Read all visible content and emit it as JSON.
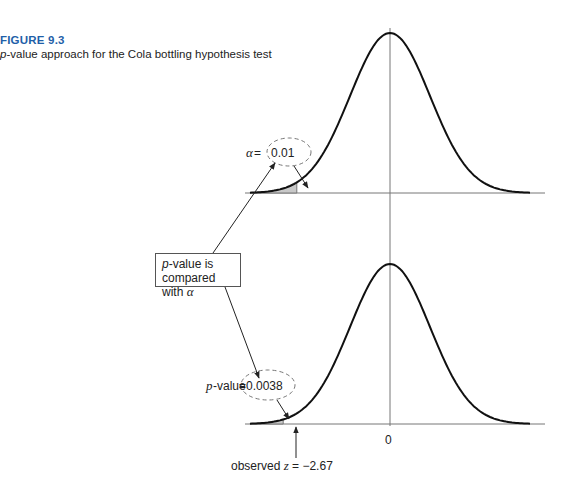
{
  "figure": {
    "label": "FIGURE 9.3",
    "caption_prefix_italic": "p",
    "caption_rest": "-value approach for the Cola bottling hypothesis test"
  },
  "top_panel": {
    "annotation_symbol": "α",
    "annotation_eq": " = ",
    "annotation_value": "0.01"
  },
  "bottom_panel": {
    "annotation_prefix_italic": "p",
    "annotation_label": "-value",
    "annotation_eq": " = ",
    "annotation_value": "0.0038",
    "axis_zero_label": "0",
    "observed_label": "observed ",
    "observed_var": "z",
    "observed_value": " = −2.67"
  },
  "comparison_box": {
    "line1_italic": "p",
    "line1_rest": "-value is",
    "line2": "compared with ",
    "line2_symbol": "α"
  },
  "colors": {
    "figure_label": "#1f5fa8",
    "curve": "#111111",
    "axis": "#777777",
    "shade": "#c8c8c8",
    "dashed": "#777777"
  },
  "chart_data": [
    {
      "type": "area",
      "title": "Rejection region for alpha",
      "distribution": "standard normal",
      "mean": 0,
      "critical_z": -2.33,
      "shaded_tail": "left",
      "shaded_area": 0.01
    },
    {
      "type": "area",
      "title": "p-value for observed z",
      "distribution": "standard normal",
      "mean": 0,
      "observed_z": -2.67,
      "shaded_tail": "left",
      "shaded_area": 0.0038,
      "tick_labels": [
        "0"
      ]
    }
  ]
}
